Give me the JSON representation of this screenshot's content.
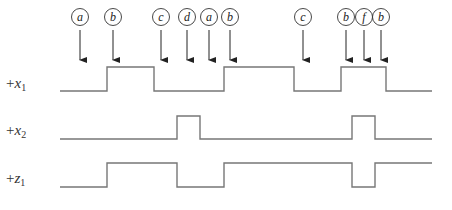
{
  "diagram": {
    "type": "timing-diagram",
    "colors": {
      "waveform": "#777777",
      "arrow": "#222222",
      "circle": "#333333",
      "label": "#333333",
      "background": "#ffffff"
    },
    "state_markers": [
      {
        "label": "a",
        "x": 80
      },
      {
        "label": "b",
        "x": 113
      },
      {
        "label": "c",
        "x": 161
      },
      {
        "label": "d",
        "x": 187
      },
      {
        "label": "a",
        "x": 209
      },
      {
        "label": "b",
        "x": 230
      },
      {
        "label": "c",
        "x": 303
      },
      {
        "label": "b",
        "x": 346
      },
      {
        "label": "f",
        "x": 364
      },
      {
        "label": "b",
        "x": 381
      }
    ],
    "signals": [
      {
        "name": "+x",
        "subscript": "1",
        "label_y": 85,
        "high_y": 67,
        "low_y": 91,
        "start_x": 60,
        "end_x": 432,
        "initial": 0,
        "transitions": [
          107,
          154,
          224,
          294,
          341,
          386
        ]
      },
      {
        "name": "+x",
        "subscript": "2",
        "label_y": 132,
        "high_y": 116,
        "low_y": 139,
        "start_x": 60,
        "end_x": 432,
        "initial": 0,
        "transitions": [
          177,
          200,
          352,
          375
        ]
      },
      {
        "name": "+z",
        "subscript": "1",
        "label_y": 180,
        "high_y": 163,
        "low_y": 187,
        "start_x": 60,
        "end_x": 432,
        "initial": 0,
        "transitions": [
          107,
          177,
          224,
          352,
          375
        ]
      }
    ]
  }
}
